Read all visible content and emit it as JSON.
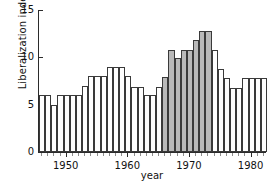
{
  "axes": {
    "ylabel": "Liberalization index",
    "xlabel": "year",
    "yticks": [
      "0",
      "5",
      "10",
      "15"
    ],
    "xticks": [
      "1950",
      "1960",
      "1970",
      "1980"
    ]
  },
  "colors": {
    "bar_fill": "#ffffff",
    "bar_shaded_fill": "#b9b9b9",
    "bar_stroke": "#3a3a3a",
    "axis": "#2b2b2b",
    "text": "#111111"
  },
  "chart_data": {
    "type": "bar",
    "title": "",
    "xlabel": "year",
    "ylabel": "Liberalization index",
    "ylim": [
      0,
      15
    ],
    "xlim": [
      1945.5,
      1982.5
    ],
    "yticks": [
      0,
      5,
      10,
      15
    ],
    "xticks": [
      1950,
      1960,
      1970,
      1980
    ],
    "grid": false,
    "legend": null,
    "highlight_note": "Bars from 1966 through 1973 are shaded gray",
    "highlight_range": [
      1966,
      1973
    ],
    "categories": [
      1946,
      1947,
      1948,
      1949,
      1950,
      1951,
      1952,
      1953,
      1954,
      1955,
      1956,
      1957,
      1958,
      1959,
      1960,
      1961,
      1962,
      1963,
      1964,
      1965,
      1966,
      1967,
      1968,
      1969,
      1970,
      1971,
      1972,
      1973,
      1974,
      1975,
      1976,
      1977,
      1978,
      1979,
      1980,
      1981,
      1982
    ],
    "values": [
      6.0,
      6.0,
      5.0,
      6.0,
      6.0,
      6.0,
      6.0,
      7.0,
      8.0,
      8.0,
      8.0,
      9.0,
      9.0,
      9.0,
      8.0,
      6.9,
      6.9,
      6.0,
      6.0,
      6.9,
      7.9,
      10.8,
      9.9,
      10.8,
      10.8,
      11.8,
      12.8,
      12.8,
      10.8,
      8.8,
      7.8,
      6.8,
      6.8,
      7.8,
      7.8,
      7.8,
      7.8
    ],
    "shaded": [
      false,
      false,
      false,
      false,
      false,
      false,
      false,
      false,
      false,
      false,
      false,
      false,
      false,
      false,
      false,
      false,
      false,
      false,
      false,
      false,
      true,
      true,
      true,
      true,
      true,
      true,
      true,
      true,
      false,
      false,
      false,
      false,
      false,
      false,
      false,
      false,
      false
    ]
  }
}
